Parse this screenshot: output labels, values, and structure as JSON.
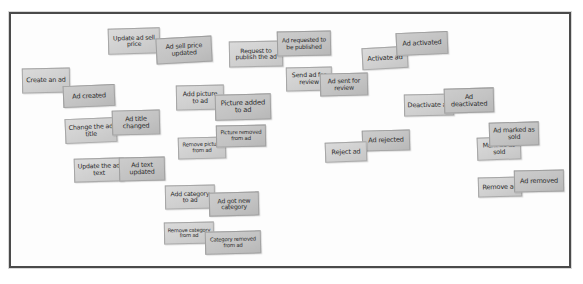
{
  "board": {
    "title": "Event Storming Board",
    "frame_color": "#4a4a4a",
    "background_color": "#fdfdfd",
    "command_color": "#d2d2d2",
    "event_color": "#c4c4c4",
    "width": 583,
    "height": 284
  },
  "notes": [
    {
      "id": "update-ad-sell-price",
      "kind": "command",
      "label": "Update ad sell price",
      "x": 108,
      "y": 28,
      "w": 52,
      "h": 26,
      "rot": -1.5,
      "fs": 6.2
    },
    {
      "id": "ad-sell-price-updated",
      "kind": "event",
      "label": "Ad sell price updated",
      "x": 156,
      "y": 37,
      "w": 56,
      "h": 26,
      "rot": -3.0,
      "fs": 6.4
    },
    {
      "id": "request-to-publish-the-ad",
      "kind": "command",
      "label": "Request to publish the ad",
      "x": 229,
      "y": 41,
      "w": 54,
      "h": 26,
      "rot": -1.0,
      "fs": 6.2
    },
    {
      "id": "ad-requested-to-be-published",
      "kind": "event",
      "label": "Ad requested to be published",
      "x": 277,
      "y": 31,
      "w": 54,
      "h": 25,
      "rot": -1.2,
      "fs": 5.9
    },
    {
      "id": "activate-ad",
      "kind": "command",
      "label": "Activate ad",
      "x": 362,
      "y": 47,
      "w": 46,
      "h": 22,
      "rot": -3.0,
      "fs": 6.6
    },
    {
      "id": "ad-activated",
      "kind": "event",
      "label": "Ad activated",
      "x": 396,
      "y": 32,
      "w": 52,
      "h": 23,
      "rot": -2.5,
      "fs": 6.6
    },
    {
      "id": "create-an-ad",
      "kind": "command",
      "label": "Create an ad",
      "x": 22,
      "y": 68,
      "w": 48,
      "h": 25,
      "rot": -1.0,
      "fs": 6.5
    },
    {
      "id": "ad-created",
      "kind": "event",
      "label": "Ad created",
      "x": 63,
      "y": 85,
      "w": 52,
      "h": 22,
      "rot": -2.5,
      "fs": 6.6
    },
    {
      "id": "send-ad-for-review",
      "kind": "command",
      "label": "Send ad for review",
      "x": 286,
      "y": 67,
      "w": 46,
      "h": 24,
      "rot": -1.0,
      "fs": 6.3
    },
    {
      "id": "ad-sent-for-review",
      "kind": "event",
      "label": "Ad sent for review",
      "x": 320,
      "y": 73,
      "w": 48,
      "h": 23,
      "rot": -1.5,
      "fs": 6.3
    },
    {
      "id": "add-picture-to-ad",
      "kind": "command",
      "label": "Add picture to ad",
      "x": 176,
      "y": 85,
      "w": 48,
      "h": 25,
      "rot": -1.0,
      "fs": 6.4
    },
    {
      "id": "picture-added-to-ad",
      "kind": "event",
      "label": "Picture added to ad",
      "x": 215,
      "y": 94,
      "w": 56,
      "h": 26,
      "rot": -1.5,
      "fs": 6.8
    },
    {
      "id": "deactivate-ad",
      "kind": "command",
      "label": "Deactivate ad",
      "x": 404,
      "y": 94,
      "w": 50,
      "h": 22,
      "rot": -1.0,
      "fs": 6.5
    },
    {
      "id": "ad-deactivated",
      "kind": "event",
      "label": "Ad deactivated",
      "x": 444,
      "y": 88,
      "w": 50,
      "h": 25,
      "rot": -1.5,
      "fs": 6.5
    },
    {
      "id": "change-the-ad-title",
      "kind": "command",
      "label": "Change the ad title",
      "x": 65,
      "y": 118,
      "w": 52,
      "h": 25,
      "rot": -2.5,
      "fs": 6.4
    },
    {
      "id": "ad-title-changed",
      "kind": "event",
      "label": "Ad title changed",
      "x": 112,
      "y": 110,
      "w": 48,
      "h": 25,
      "rot": -1.5,
      "fs": 6.5
    },
    {
      "id": "remove-picture-from-ad",
      "kind": "command",
      "label": "Remove picture from ad",
      "x": 178,
      "y": 137,
      "w": 48,
      "h": 22,
      "rot": -1.5,
      "fs": 5.3
    },
    {
      "id": "picture-removed-from-ad",
      "kind": "event",
      "label": "Picture removed from ad",
      "x": 216,
      "y": 125,
      "w": 50,
      "h": 22,
      "rot": -1.0,
      "fs": 5.4
    },
    {
      "id": "ad-rejected",
      "kind": "event",
      "label": "Ad rejected",
      "x": 362,
      "y": 130,
      "w": 48,
      "h": 21,
      "rot": -1.5,
      "fs": 6.6
    },
    {
      "id": "reject-ad",
      "kind": "command",
      "label": "Reject ad",
      "x": 325,
      "y": 142,
      "w": 42,
      "h": 20,
      "rot": -2.0,
      "fs": 6.6
    },
    {
      "id": "mark-ad-as-sold",
      "kind": "command",
      "label": "Mark ad as sold",
      "x": 477,
      "y": 137,
      "w": 44,
      "h": 23,
      "rot": -2.0,
      "fs": 6.3
    },
    {
      "id": "ad-marked-as-sold",
      "kind": "event",
      "label": "Ad marked as sold",
      "x": 489,
      "y": 122,
      "w": 50,
      "h": 24,
      "rot": -1.5,
      "fs": 6.4
    },
    {
      "id": "update-the-ad-text",
      "kind": "command",
      "label": "Update the ad text",
      "x": 74,
      "y": 158,
      "w": 50,
      "h": 24,
      "rot": -1.5,
      "fs": 6.3
    },
    {
      "id": "ad-text-updated",
      "kind": "event",
      "label": "Ad text updated",
      "x": 119,
      "y": 157,
      "w": 46,
      "h": 24,
      "rot": -1.5,
      "fs": 6.4
    },
    {
      "id": "remove-ad",
      "kind": "command",
      "label": "Remove ad",
      "x": 478,
      "y": 177,
      "w": 44,
      "h": 20,
      "rot": -1.5,
      "fs": 6.6
    },
    {
      "id": "ad-removed",
      "kind": "event",
      "label": "Ad removed",
      "x": 514,
      "y": 170,
      "w": 50,
      "h": 22,
      "rot": -1.0,
      "fs": 6.6
    },
    {
      "id": "add-category-to-ad",
      "kind": "command",
      "label": "Add category to ad",
      "x": 165,
      "y": 185,
      "w": 50,
      "h": 24,
      "rot": -1.0,
      "fs": 6.2
    },
    {
      "id": "ad-got-new-category",
      "kind": "event",
      "label": "Ad got new category",
      "x": 209,
      "y": 192,
      "w": 50,
      "h": 24,
      "rot": -1.5,
      "fs": 6.2
    },
    {
      "id": "remove-category-from-ad",
      "kind": "command",
      "label": "Remove category from ad",
      "x": 164,
      "y": 222,
      "w": 50,
      "h": 22,
      "rot": -1.0,
      "fs": 5.2
    },
    {
      "id": "category-removed-from-ad",
      "kind": "event",
      "label": "Category removed from ad",
      "x": 205,
      "y": 231,
      "w": 56,
      "h": 23,
      "rot": -1.5,
      "fs": 5.3
    }
  ]
}
